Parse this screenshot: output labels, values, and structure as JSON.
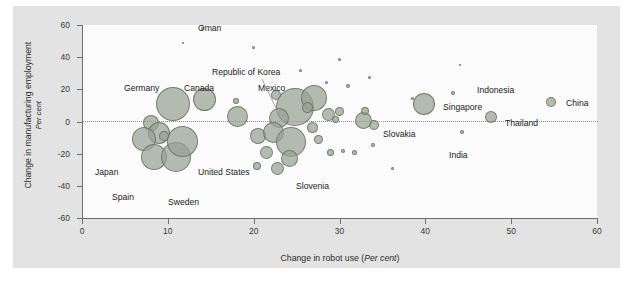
{
  "chart_data": {
    "type": "scatter",
    "title": "",
    "xlabel": "Change in robot use (Per cent)",
    "xlabel_main": "Change in robot use",
    "xlabel_unit": "Per cent",
    "ylabel": "Change in manufacturing employment (Per cent)",
    "ylabel_main": "Change in manufacturing employment",
    "ylabel_unit": "Per cent",
    "xlim": [
      0,
      60
    ],
    "ylim": [
      -60,
      60
    ],
    "xticks": [
      0,
      10,
      20,
      30,
      40,
      50,
      60
    ],
    "yticks": [
      -60,
      -40,
      -20,
      0,
      20,
      40,
      60
    ],
    "grid": false,
    "reference_line_y": 0,
    "legend": "none",
    "size_meaning": "bubble area scales with economy / employment size",
    "points": [
      {
        "label": "Oman",
        "x": 14.0,
        "y": 58.0,
        "size": 3
      },
      {
        "label": "",
        "x": 11.8,
        "y": 48.5,
        "size": 2
      },
      {
        "label": "",
        "x": 20.0,
        "y": 46.0,
        "size": 3
      },
      {
        "label": "",
        "x": 30.0,
        "y": 38.5,
        "size": 3
      },
      {
        "label": "",
        "x": 25.5,
        "y": 32.0,
        "size": 3
      },
      {
        "label": "",
        "x": 44.0,
        "y": 35.0,
        "size": 2
      },
      {
        "label": "",
        "x": 33.5,
        "y": 27.5,
        "size": 3
      },
      {
        "label": "",
        "x": 28.5,
        "y": 24.0,
        "size": 3
      },
      {
        "label": "",
        "x": 31.0,
        "y": 22.0,
        "size": 4
      },
      {
        "label": "Germany",
        "x": 10.6,
        "y": 11.0,
        "size": 34
      },
      {
        "label": "Canada",
        "x": 14.3,
        "y": 13.5,
        "size": 23
      },
      {
        "label": "",
        "x": 17.9,
        "y": 13.0,
        "size": 6
      },
      {
        "label": "Republic of Korea",
        "x": 22.6,
        "y": 16.5,
        "size": 10
      },
      {
        "label": "Mexico",
        "x": 24.8,
        "y": 9.0,
        "size": 38
      },
      {
        "label": "",
        "x": 27.0,
        "y": 14.5,
        "size": 26
      },
      {
        "label": "",
        "x": 26.3,
        "y": 8.5,
        "size": 11
      },
      {
        "label": "",
        "x": 28.7,
        "y": 4.5,
        "size": 13
      },
      {
        "label": "",
        "x": 30.0,
        "y": 6.0,
        "size": 9
      },
      {
        "label": "",
        "x": 23.0,
        "y": 2.0,
        "size": 20
      },
      {
        "label": "",
        "x": 29.5,
        "y": 1.0,
        "size": 7
      },
      {
        "label": "",
        "x": 18.1,
        "y": 3.0,
        "size": 21
      },
      {
        "label": "",
        "x": 8.0,
        "y": -1.0,
        "size": 16
      },
      {
        "label": "",
        "x": 9.0,
        "y": -7.0,
        "size": 22
      },
      {
        "label": "Japan",
        "x": 7.2,
        "y": -11.0,
        "size": 24
      },
      {
        "label": "",
        "x": 9.5,
        "y": -9.0,
        "size": 10
      },
      {
        "label": "Spain",
        "x": 8.4,
        "y": -22.0,
        "size": 26
      },
      {
        "label": "Sweden",
        "x": 10.9,
        "y": -22.0,
        "size": 30
      },
      {
        "label": "United States",
        "x": 11.7,
        "y": -12.5,
        "size": 31
      },
      {
        "label": "",
        "x": 20.5,
        "y": -9.0,
        "size": 16
      },
      {
        "label": "",
        "x": 22.3,
        "y": -7.0,
        "size": 21
      },
      {
        "label": "",
        "x": 24.4,
        "y": -13.0,
        "size": 30
      },
      {
        "label": "",
        "x": 21.5,
        "y": -19.0,
        "size": 13
      },
      {
        "label": "",
        "x": 24.2,
        "y": -23.0,
        "size": 17
      },
      {
        "label": "Slovenia",
        "x": 22.8,
        "y": -29.0,
        "size": 13
      },
      {
        "label": "",
        "x": 20.4,
        "y": -27.5,
        "size": 8
      },
      {
        "label": "",
        "x": 26.8,
        "y": -4.0,
        "size": 11
      },
      {
        "label": "",
        "x": 27.5,
        "y": -11.5,
        "size": 9
      },
      {
        "label": "",
        "x": 29.0,
        "y": -19.0,
        "size": 7
      },
      {
        "label": "",
        "x": 30.4,
        "y": -18.5,
        "size": 4
      },
      {
        "label": "",
        "x": 31.8,
        "y": -19.5,
        "size": 5
      },
      {
        "label": "",
        "x": 33.9,
        "y": -14.5,
        "size": 4
      },
      {
        "label": "",
        "x": 34.0,
        "y": -2.0,
        "size": 10
      },
      {
        "label": "Slovakia",
        "x": 32.8,
        "y": 0.5,
        "size": 17
      },
      {
        "label": "",
        "x": 33.0,
        "y": 6.5,
        "size": 8
      },
      {
        "label": "",
        "x": 38.5,
        "y": 14.5,
        "size": 3
      },
      {
        "label": "Singapore",
        "x": 39.9,
        "y": 11.0,
        "size": 22
      },
      {
        "label": "Indonesia",
        "x": 43.2,
        "y": 17.5,
        "size": 4
      },
      {
        "label": "Thailand",
        "x": 47.7,
        "y": 3.0,
        "size": 12
      },
      {
        "label": "India",
        "x": 44.3,
        "y": -6.5,
        "size": 4
      },
      {
        "label": "China",
        "x": 54.6,
        "y": 12.0,
        "size": 10
      },
      {
        "label": "",
        "x": 36.2,
        "y": -29.0,
        "size": 3
      }
    ],
    "annotations": [
      {
        "name": "korea-leader-line",
        "desc": "thin leader line from Republic of Korea label to its bubble"
      }
    ]
  },
  "colors": {
    "figure_background": "#e3e3e3",
    "plot_background": "#fbfbfb",
    "bubble_fill": "#97a191",
    "bubble_stroke": "#697364",
    "axis": "#6d6d6d",
    "text": "#222222",
    "zero_line": "#8e8e8e"
  }
}
